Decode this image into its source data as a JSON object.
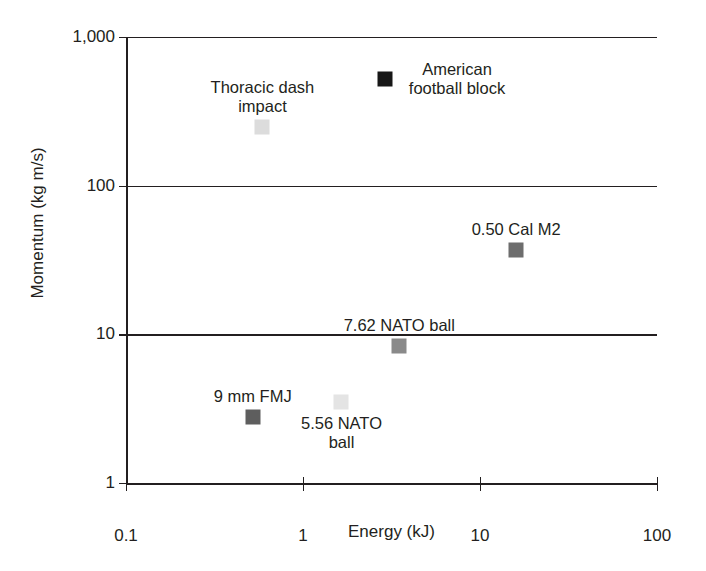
{
  "chart_data": {
    "type": "scatter",
    "title": "",
    "xlabel": "Energy (kJ)",
    "ylabel": "Momentum (kg m/s)",
    "xscale": "log",
    "yscale": "log",
    "xlim": [
      0.1,
      100
    ],
    "ylim": [
      1,
      1000
    ],
    "xticks": [
      "0.1",
      "1",
      "10",
      "100"
    ],
    "yticks": [
      "1",
      "10",
      "100",
      "1,000"
    ],
    "grid": "horizontal",
    "legend": "none (points labeled directly)",
    "points": [
      {
        "label": "Thoracic dash\nimpact",
        "name": "thoracic-dash-impact",
        "x": 0.59,
        "y": 250,
        "color": "#dcdcdc",
        "label_position": "above"
      },
      {
        "label": "American\nfootball block",
        "name": "american-football-block",
        "x": 2.9,
        "y": 520,
        "color": "#171717",
        "label_position": "right"
      },
      {
        "label": "0.50 Cal M2",
        "name": "050-cal-m2",
        "x": 16,
        "y": 37,
        "color": "#6d6d6d",
        "label_position": "above"
      },
      {
        "label": "7.62 NATO ball",
        "name": "762-nato-ball",
        "x": 3.5,
        "y": 8.3,
        "color": "#8a8a8a",
        "label_position": "above"
      },
      {
        "label": "9 mm FMJ",
        "name": "9mm-fmj",
        "x": 0.52,
        "y": 2.8,
        "color": "#5e5e5e",
        "label_position": "above"
      },
      {
        "label": "5.56 NATO\nball",
        "name": "556-nato-ball",
        "x": 1.65,
        "y": 3.5,
        "color": "#e4e4e4",
        "label_position": "below"
      }
    ]
  },
  "axis": {
    "x": {
      "title": "Energy (kJ)",
      "ticks": [
        {
          "label": "0.1",
          "value": 0.1
        },
        {
          "label": "1",
          "value": 1
        },
        {
          "label": "10",
          "value": 10
        },
        {
          "label": "100",
          "value": 100
        }
      ]
    },
    "y": {
      "title": "Momentum (kg m/s)",
      "ticks": [
        {
          "label": "1",
          "value": 1
        },
        {
          "label": "10",
          "value": 10
        },
        {
          "label": "100",
          "value": 100
        },
        {
          "label": "1,000",
          "value": 1000
        }
      ]
    }
  },
  "style": {
    "axis_color": "#231f20",
    "background": "#ffffff",
    "text_color": "#231f20"
  }
}
